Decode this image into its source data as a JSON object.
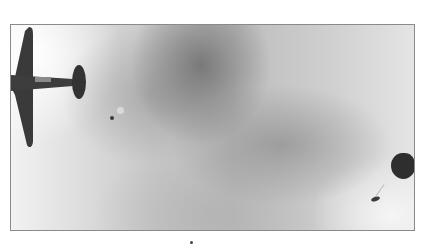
{
  "image": {
    "description": "Grayscale photograph: a monoplane viewed from below at the left edge, a small distant parachutist near center-left, and an open dark parachute with a jumper at the right edge, against a cloudy sky",
    "subjects": [
      "aircraft",
      "parachutist-small",
      "parachute-canopy",
      "parachutist-right"
    ],
    "colors": {
      "frame_border": "#8a8a8a",
      "sky_light": "#f2f2f2",
      "sky_dark": "#bcbcbc",
      "silhouette": "#3a3a3a"
    }
  }
}
